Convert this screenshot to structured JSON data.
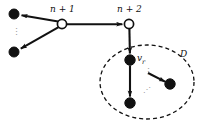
{
  "figure": {
    "kind": "directed-graph-diagram",
    "background_color": "#ffffff",
    "stroke_color": "#111111",
    "ellipsis_color": "#9a9a9a",
    "width": 201,
    "height": 125
  },
  "labels": {
    "node_n_plus_1": "n + 1",
    "node_n_plus_2": "n + 2",
    "node_v_r_base": "v",
    "node_v_r_sub": "r",
    "region_d": "D",
    "ellipsis_vertical": "⋮",
    "ellipsis_diagonal": "⋰"
  },
  "nodes": [
    {
      "id": "a-top",
      "name": "filled-node-top-left",
      "style": "filled",
      "cx": 14,
      "cy": 14,
      "r": 5.0
    },
    {
      "id": "a-bot",
      "name": "filled-node-bottom-left",
      "style": "filled",
      "cx": 14,
      "cy": 52,
      "r": 5.0
    },
    {
      "id": "n1",
      "name": "open-node-n-plus-1",
      "style": "open",
      "cx": 62,
      "cy": 24,
      "r": 4.6
    },
    {
      "id": "n2",
      "name": "open-node-n-plus-2",
      "style": "open",
      "cx": 129,
      "cy": 24,
      "r": 4.6
    },
    {
      "id": "vr",
      "name": "filled-node-v-r",
      "style": "filled",
      "cx": 130,
      "cy": 60,
      "r": 5.2
    },
    {
      "id": "d-bot",
      "name": "filled-node-d-bottom",
      "style": "filled",
      "cx": 130,
      "cy": 103,
      "r": 5.2
    },
    {
      "id": "d-right",
      "name": "filled-node-d-right",
      "style": "filled",
      "cx": 170,
      "cy": 84,
      "r": 5.2
    }
  ],
  "edges": [
    {
      "id": "e1",
      "name": "edge-n1-to-top-left",
      "from": "n1",
      "to": "a-top",
      "arrow": true
    },
    {
      "id": "e2",
      "name": "edge-n1-to-bottom-left",
      "from": "n1",
      "to": "a-bot",
      "arrow": true
    },
    {
      "id": "e3",
      "name": "edge-n1-to-n2",
      "from": "n1",
      "to": "n2",
      "arrow": true
    },
    {
      "id": "e4",
      "name": "edge-n2-to-vr",
      "from": "n2",
      "to": "vr",
      "arrow": true
    },
    {
      "id": "e5",
      "name": "edge-vr-to-d-bottom",
      "from": "vr",
      "to": "d-bot",
      "arrow": true
    },
    {
      "id": "e6",
      "name": "edge-to-d-right",
      "from": "inner",
      "to": "d-right",
      "arrow": true
    }
  ],
  "region": {
    "name": "dashed-ellipse-d",
    "cx": 147,
    "cy": 82,
    "rx": 47,
    "ry": 37,
    "dash": "4 3",
    "label": "D"
  }
}
